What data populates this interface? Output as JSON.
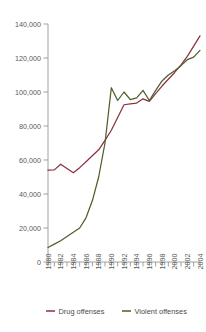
{
  "chart_data": {
    "type": "line",
    "title": "",
    "subtitle": "",
    "xlabel": "",
    "ylabel": "",
    "x": [
      1980,
      1981,
      1982,
      1983,
      1984,
      1985,
      1986,
      1987,
      1988,
      1989,
      1990,
      1991,
      1992,
      1993,
      1994,
      1995,
      1996,
      1997,
      1998,
      1999,
      2000,
      2001,
      2002,
      2003,
      2004
    ],
    "xlim": [
      1980,
      2004
    ],
    "ylim": [
      0,
      140000
    ],
    "ytick_values": [
      0,
      20000,
      40000,
      60000,
      80000,
      100000,
      120000,
      140000
    ],
    "ytick_labels": [
      "0",
      "20,000",
      "40,000",
      "60,000",
      "80,000",
      "100,000",
      "120,000",
      "140,000"
    ],
    "xtick_values": [
      1980,
      1982,
      1984,
      1986,
      1988,
      1990,
      1992,
      1994,
      1996,
      1998,
      2000,
      2002,
      2004
    ],
    "xtick_labels": [
      "1980",
      "1982",
      "1984",
      "1986",
      "1988",
      "1990",
      "1992",
      "1994",
      "1996",
      "1998",
      "2000",
      "2002",
      "2004"
    ],
    "xtick_minor_values": [
      1981,
      1983,
      1985,
      1987,
      1989,
      1991,
      1993,
      1995,
      1997,
      1999,
      2001,
      2003
    ],
    "grid": false,
    "legend_position": "bottom",
    "series": [
      {
        "name": "Drug offenses",
        "color": "#8c3140",
        "values": [
          54000,
          54200,
          57500,
          55000,
          52500,
          55500,
          59000,
          62500,
          66000,
          71500,
          77500,
          85000,
          92500,
          93000,
          93500,
          96000,
          94500,
          99000,
          103500,
          107500,
          111500,
          116000,
          121000,
          127000,
          133000
        ]
      },
      {
        "name": "Violent offenses",
        "color": "#4d5f2a",
        "values": [
          8500,
          10500,
          12500,
          15000,
          17500,
          20000,
          26000,
          36000,
          50000,
          70000,
          102500,
          95000,
          100000,
          95500,
          96500,
          101000,
          95000,
          101000,
          106500,
          110000,
          112500,
          115500,
          119000,
          120500,
          124500
        ]
      }
    ]
  },
  "legend": {
    "items": [
      {
        "label": "Drug offenses",
        "color": "#8c3140"
      },
      {
        "label": "Violent offenses",
        "color": "#4d5f2a"
      }
    ]
  }
}
